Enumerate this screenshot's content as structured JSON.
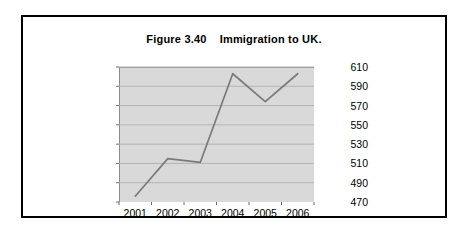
{
  "figure": {
    "title": "Figure 3.40    Immigration to UK."
  },
  "chart_data": {
    "type": "line",
    "title": "Figure 3.40    Immigration to UK.",
    "categories": [
      "2001",
      "2002",
      "2003",
      "2004",
      "2005",
      "2006"
    ],
    "values": [
      476,
      515,
      511,
      603,
      574,
      603
    ],
    "series": [
      {
        "name": "Immigration to UK",
        "values": [
          476,
          515,
          511,
          603,
          574,
          603
        ],
        "color": "#7a7a7a"
      }
    ],
    "xlabel": "",
    "ylabel": "",
    "ylim": [
      470,
      610
    ],
    "yticks": [
      470,
      490,
      510,
      530,
      550,
      570,
      590,
      610
    ],
    "ytick_labels": [
      "470",
      "490",
      "510",
      "530",
      "550",
      "570",
      "590",
      "610"
    ],
    "xtick_labels": [
      "2001",
      "2002",
      "2003",
      "2004",
      "2005",
      "2006"
    ],
    "y_axis_position": "right",
    "grid": true,
    "grid_color": "#b4b4b4",
    "plot_background": "#d9d9d9",
    "legend": "none",
    "legend_position": "none"
  }
}
